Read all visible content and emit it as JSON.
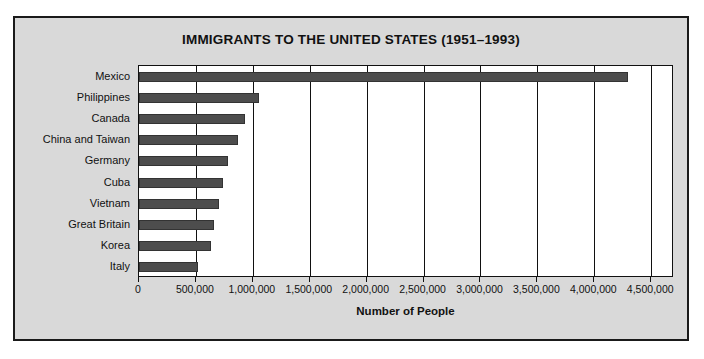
{
  "chart_data": {
    "type": "bar",
    "orientation": "horizontal",
    "title": "IMMIGRANTS TO THE UNITED STATES (1951–1993)",
    "xlabel": "Number of People",
    "ylabel": "",
    "categories": [
      "Mexico",
      "Philippines",
      "Canada",
      "China and Taiwan",
      "Germany",
      "Cuba",
      "Vietnam",
      "Great Britain",
      "Korea",
      "Italy"
    ],
    "values": [
      4300000,
      1050000,
      930000,
      870000,
      780000,
      740000,
      700000,
      660000,
      635000,
      520000
    ],
    "xlim": [
      0,
      4700000
    ],
    "xticks": [
      0,
      500000,
      1000000,
      1500000,
      2000000,
      2500000,
      3000000,
      3500000,
      4000000,
      4500000
    ],
    "xticklabels": [
      "0",
      "500,000",
      "1,000,000",
      "1,500,000",
      "2,000,000",
      "2,500,000",
      "3,000,000",
      "3,500,000",
      "4,000,000",
      "4,500,000"
    ],
    "grid": true,
    "grid_axis": "x",
    "legend": false,
    "bar_color": "#4d4d4d",
    "plot_background": "#ffffff",
    "figure_background": "#d9d9d9",
    "border_color": "#1a1a1a"
  }
}
